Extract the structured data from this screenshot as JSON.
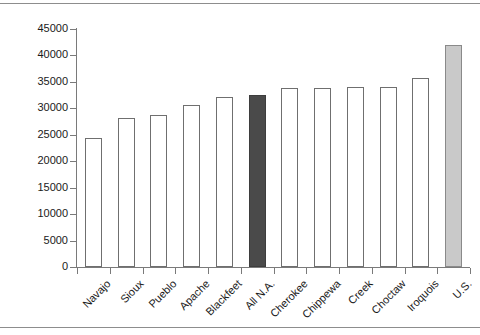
{
  "page": {
    "background_color": "#ffffff",
    "rule_color": "#8d8d8d"
  },
  "chart_data": {
    "type": "bar",
    "title": "",
    "subtitle": "",
    "xlabel": "",
    "ylabel": "",
    "ylim": [
      0,
      45000
    ],
    "ytick_step": 5000,
    "grid": false,
    "legend": "none",
    "categories": [
      "Navajo",
      "Sioux",
      "Pueblo",
      "Apache",
      "Blackfeet",
      "All N.A.",
      "Cherokee",
      "Chippewa",
      "Creek",
      "Choctaw",
      "Iroquois",
      "U.S."
    ],
    "values": [
      24400,
      28200,
      28800,
      30600,
      32100,
      32500,
      33800,
      33800,
      34000,
      34100,
      35700,
      42000
    ],
    "ytick_labels": [
      "0",
      "5000",
      "10000",
      "15000",
      "20000",
      "25000",
      "30000",
      "35000",
      "40000",
      "45000"
    ],
    "ytick_values": [
      0,
      5000,
      10000,
      15000,
      20000,
      25000,
      30000,
      35000,
      40000,
      45000
    ],
    "bar_styles": [
      "open",
      "open",
      "open",
      "open",
      "open",
      "dark",
      "open",
      "open",
      "open",
      "open",
      "open",
      "light"
    ],
    "colors": {
      "open_fill": "#ffffff",
      "open_border": "#6f6f6f",
      "dark_fill": "#4a4a4a",
      "light_fill": "#c9c9c9",
      "axis": "#7a7a7a",
      "text": "#1a1a1a"
    }
  }
}
